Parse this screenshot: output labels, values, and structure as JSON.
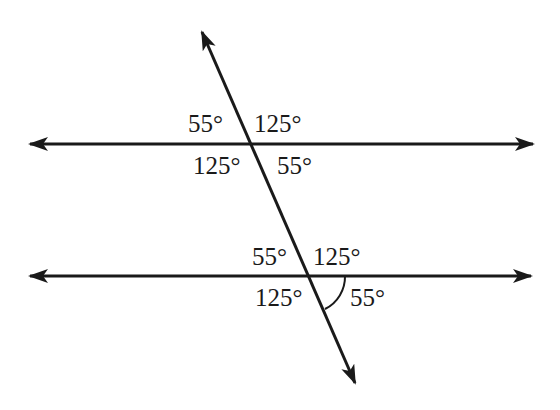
{
  "diagram": {
    "stroke_color": "#1a1a1a",
    "top_intersection": {
      "upper_left": "55°",
      "upper_right": "125°",
      "lower_left": "125°",
      "lower_right": "55°"
    },
    "bottom_intersection": {
      "upper_left": "55°",
      "upper_right": "125°",
      "lower_left": "125°",
      "lower_right": "55°",
      "marked_angle": "lower_right"
    }
  }
}
